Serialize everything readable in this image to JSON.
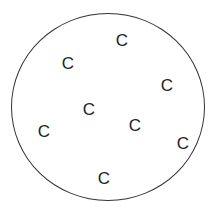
{
  "diagram": {
    "circle_color": "#333333",
    "particles": [
      {
        "label": "C",
        "x": 122,
        "y": 40
      },
      {
        "label": "C",
        "x": 68,
        "y": 63
      },
      {
        "label": "C",
        "x": 167,
        "y": 85
      },
      {
        "label": "C",
        "x": 89,
        "y": 109
      },
      {
        "label": "C",
        "x": 135,
        "y": 125
      },
      {
        "label": "C",
        "x": 44,
        "y": 131
      },
      {
        "label": "C",
        "x": 183,
        "y": 143
      },
      {
        "label": "C",
        "x": 104,
        "y": 178
      }
    ]
  }
}
